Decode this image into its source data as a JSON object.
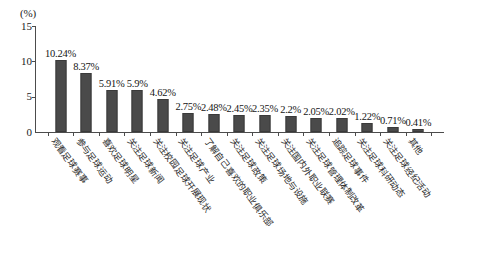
{
  "chart_data": {
    "type": "bar",
    "title": "",
    "subtitle": "",
    "xlabel": "",
    "ylabel": "(%)",
    "ylim": [
      0,
      15
    ],
    "yticks": [
      0,
      5,
      10,
      15
    ],
    "ytick_labels": [
      "0",
      "5",
      "10",
      "15"
    ],
    "grid": false,
    "legend": null,
    "bar_color": "#4a4a4a",
    "axis_color": "#4c4c4c",
    "background": "#ffffff",
    "categories": [
      "观看足球赛事",
      "参与足球运动",
      "喜欢足球明星",
      "关注足球新闻",
      "关注校园足球开展现状",
      "关注足球产业",
      "了解自己喜欢的职业俱乐部",
      "关注足球政策",
      "关注足球场地与设施",
      "关注国内外职业联赛",
      "关注足球管理体制改革",
      "追踪足球事件",
      "关注足球科研动态",
      "关注足球经纪活动",
      "其他"
    ],
    "values": [
      10.24,
      8.37,
      5.91,
      5.9,
      4.62,
      2.75,
      2.48,
      2.45,
      2.35,
      2.2,
      2.05,
      2.02,
      1.22,
      0.71,
      0.41
    ],
    "data_labels": [
      "10.24%",
      "8.37%",
      "5.91%",
      "5.9%",
      "4.62%",
      "2.75%",
      "2.48%",
      "2.45%",
      "2.35%",
      "2.2%",
      "2.05%",
      "2.02%",
      "1.22%",
      "0.71%",
      "0.41%"
    ]
  }
}
